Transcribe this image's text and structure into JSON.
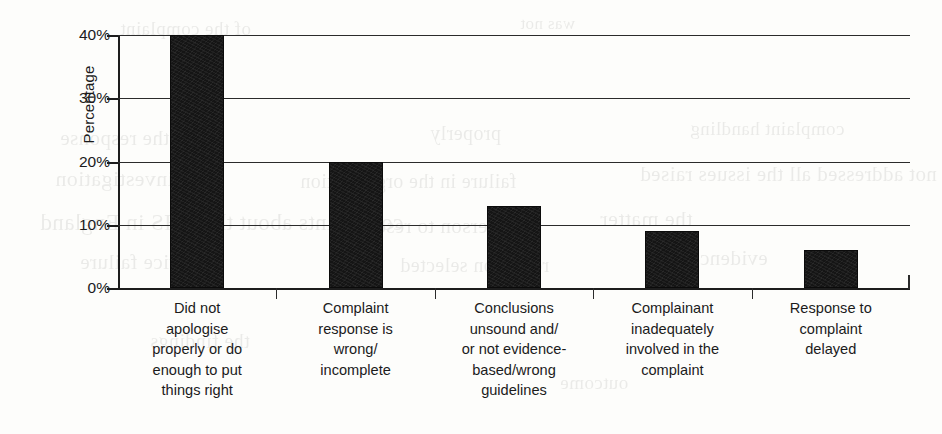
{
  "chart_data": {
    "type": "bar",
    "title": "",
    "subtitle": "",
    "xlabel": "",
    "ylabel": "Percentage",
    "ylim": [
      0,
      40
    ],
    "ytick_values": [
      0,
      10,
      20,
      30,
      40
    ],
    "ytick_labels": [
      "0%",
      "10%",
      "20%",
      "30%",
      "40%"
    ],
    "grid": "horizontal",
    "legend": "none",
    "bar_color": "#151515",
    "categories": [
      "Did not apologise properly or do enough to put things right",
      "Complaint response is wrong/ incomplete",
      "Conclusions unsound and/ or not evidence-based/wrong guidelines",
      "Complainant inadequately involved in the complaint",
      "Response to complaint delayed"
    ],
    "category_lines": [
      [
        "Did not",
        "apologise",
        "properly or do",
        "enough to put",
        "things right"
      ],
      [
        "Complaint",
        "response is",
        "wrong/",
        "incomplete"
      ],
      [
        "Conclusions",
        "unsound and/",
        "or not evidence-",
        "based/wrong",
        "guidelines"
      ],
      [
        "Complainant",
        "inadequately",
        "involved in the",
        "complaint"
      ],
      [
        "Response to",
        "complaint",
        "delayed"
      ]
    ],
    "values": [
      40,
      20,
      13,
      9,
      6
    ],
    "value_labels": [
      "40%",
      "20%",
      "13%",
      "9%",
      "6%"
    ]
  },
  "background_ghost_text": [
    "of the complaint",
    "was not",
    "the response",
    "properly",
    "complaint handling",
    "investigation",
    "failure in the organisation",
    "not addressed all the issues raised",
    "complaints about the NHS in England",
    "a person to resolve it",
    "the matter",
    "service failure",
    "report on selected",
    "evidence",
    "the findings",
    "outcome"
  ]
}
